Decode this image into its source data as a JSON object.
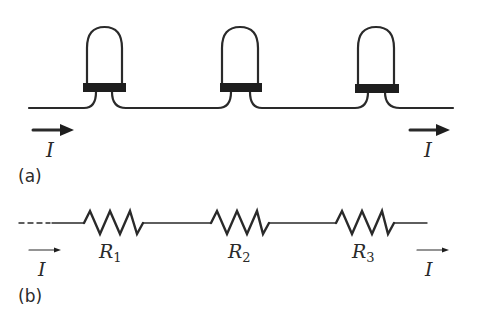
{
  "colors": {
    "stroke": "#2a2a2a",
    "background": "#ffffff"
  },
  "panel_a": {
    "label": "(a)",
    "description": "Three light bulbs connected in series",
    "current_in_label": "I",
    "current_out_label": "I",
    "bulbs": [
      {
        "name": "bulb-1"
      },
      {
        "name": "bulb-2"
      },
      {
        "name": "bulb-3"
      }
    ]
  },
  "panel_b": {
    "label": "(b)",
    "description": "Equivalent circuit: three resistors in series",
    "current_in_label": "I",
    "current_out_label": "I",
    "resistors": [
      {
        "symbol": "R",
        "subscript": "1"
      },
      {
        "symbol": "R",
        "subscript": "2"
      },
      {
        "symbol": "R",
        "subscript": "3"
      }
    ]
  }
}
